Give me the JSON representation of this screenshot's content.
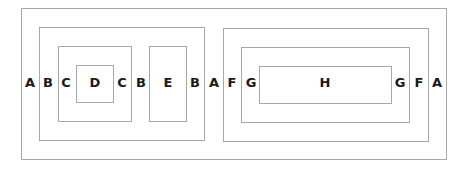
{
  "diagram": {
    "boxes": {
      "A": {
        "label": "A"
      },
      "B": {
        "label": "B"
      },
      "C": {
        "label": "C"
      },
      "D": {
        "label": "D"
      },
      "E": {
        "label": "E"
      },
      "F": {
        "label": "F"
      },
      "G": {
        "label": "G"
      },
      "H": {
        "label": "H"
      }
    },
    "row_labels": [
      "A",
      "B",
      "C",
      "D",
      "C",
      "B",
      "E",
      "B",
      "A",
      "F",
      "G",
      "H",
      "G",
      "F",
      "A"
    ],
    "line_color": "#a8a8a8",
    "text_color": "#1a1a1a"
  }
}
